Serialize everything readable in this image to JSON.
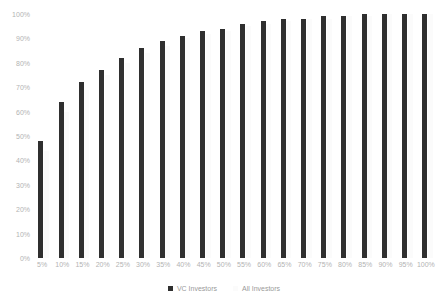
{
  "chart_data": {
    "type": "bar",
    "title": "",
    "xlabel": "",
    "ylabel": "",
    "ylim": [
      0,
      100
    ],
    "grid": false,
    "legend_position": "bottom",
    "categories": [
      "5%",
      "10%",
      "15%",
      "20%",
      "25%",
      "30%",
      "35%",
      "40%",
      "45%",
      "50%",
      "55%",
      "60%",
      "65%",
      "70%",
      "75%",
      "80%",
      "85%",
      "90%",
      "95%",
      "100%"
    ],
    "series": [
      {
        "name": "VC Investors",
        "color": "#2f2f2f",
        "values": [
          48,
          64,
          72,
          77,
          82,
          86,
          89,
          91,
          93,
          94,
          96,
          97,
          98,
          98,
          99,
          99,
          100,
          100,
          100,
          100
        ]
      },
      {
        "name": "All Investors",
        "color": "#fbfbfb",
        "values": [
          44,
          60,
          69,
          75,
          80,
          84,
          87,
          90,
          92,
          93,
          95,
          96,
          97,
          98,
          98,
          99,
          99,
          100,
          100,
          100
        ]
      }
    ],
    "y_ticks": [
      "0%",
      "10%",
      "20%",
      "30%",
      "40%",
      "50%",
      "60%",
      "70%",
      "80%",
      "90%",
      "100%"
    ],
    "y_tick_values": [
      0,
      10,
      20,
      30,
      40,
      50,
      60,
      70,
      80,
      90,
      100
    ],
    "legend": [
      "VC Investors",
      "All Investors"
    ],
    "axis_label_color": "#b3b3b3",
    "legend_label_color": "#9a9a9a",
    "background_color": "#ffffff"
  }
}
